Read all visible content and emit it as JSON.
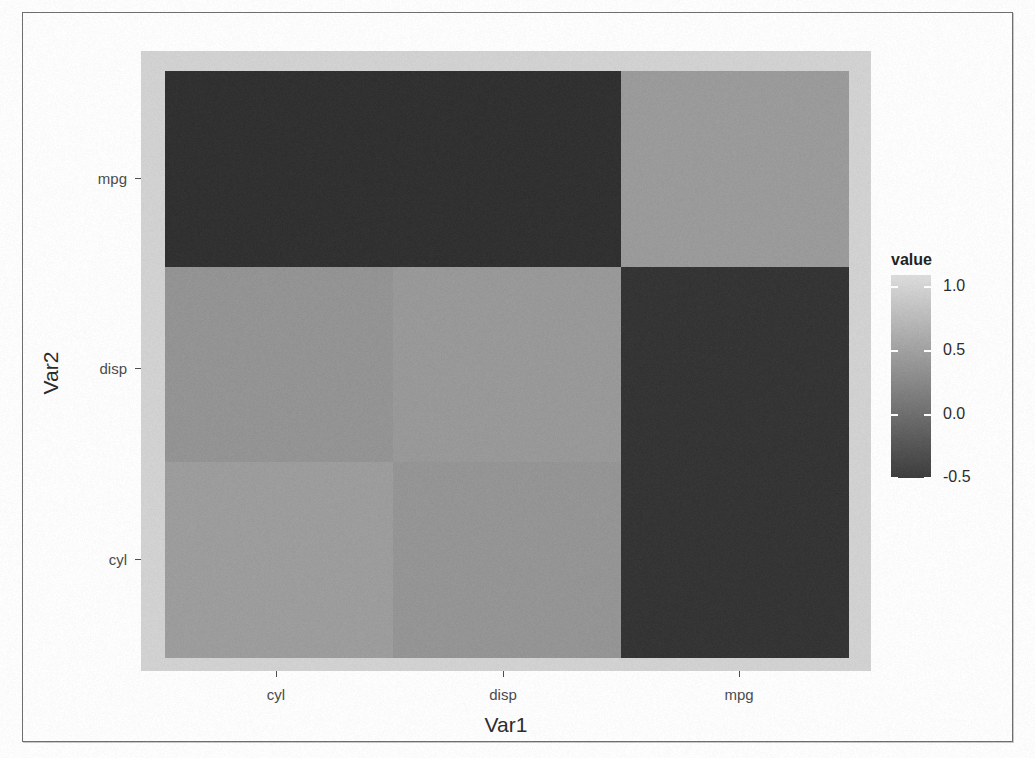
{
  "chart_data": {
    "type": "heatmap",
    "title": "",
    "xlabel": "Var1",
    "ylabel": "Var2",
    "x_categories": [
      "cyl",
      "disp",
      "mpg"
    ],
    "y_categories": [
      "cyl",
      "disp",
      "mpg"
    ],
    "legend": {
      "title": "value",
      "ticks": [
        "1.0",
        "0.5",
        "0.0",
        "-0.5"
      ],
      "tick_values": [
        1.0,
        0.5,
        0.0,
        -0.5
      ],
      "range": [
        -1.0,
        1.0
      ],
      "position": "right",
      "gradient_low": "#3b3b3b",
      "gradient_high": "#dedede"
    },
    "grid": false,
    "panel_background": "#d3d3d3",
    "cells": [
      {
        "row": "mpg",
        "col": "cyl",
        "value": -0.85,
        "color": "#2f2f2f"
      },
      {
        "row": "mpg",
        "col": "disp",
        "value": -0.85,
        "color": "#2f2f2f"
      },
      {
        "row": "mpg",
        "col": "mpg",
        "value": 1.0,
        "color": "#9b9b9b"
      },
      {
        "row": "disp",
        "col": "cyl",
        "value": 0.9,
        "color": "#949494"
      },
      {
        "row": "disp",
        "col": "disp",
        "value": 1.0,
        "color": "#999999"
      },
      {
        "row": "disp",
        "col": "mpg",
        "value": -0.85,
        "color": "#333333"
      },
      {
        "row": "cyl",
        "col": "cyl",
        "value": 1.0,
        "color": "#9d9d9d"
      },
      {
        "row": "cyl",
        "col": "disp",
        "value": 0.9,
        "color": "#959595"
      },
      {
        "row": "cyl",
        "col": "mpg",
        "value": -0.85,
        "color": "#333333"
      }
    ],
    "display_rows_top_to_bottom": [
      "mpg",
      "disp",
      "cyl"
    ],
    "ylim": [
      -1.0,
      1.0
    ]
  },
  "axes": {
    "x": {
      "title": "Var1",
      "ticks": [
        {
          "label": "cyl",
          "x": 253
        },
        {
          "label": "disp",
          "x": 480
        },
        {
          "label": "mpg",
          "x": 716
        }
      ]
    },
    "y": {
      "title": "Var2",
      "ticks": [
        {
          "label": "mpg",
          "y": 165
        },
        {
          "label": "disp",
          "y": 355
        },
        {
          "label": "cyl",
          "y": 546
        }
      ]
    }
  },
  "legend_ui": {
    "title": "value",
    "entries": [
      {
        "label": "1.0",
        "y": 11
      },
      {
        "label": "0.5",
        "y": 75
      },
      {
        "label": "0.0",
        "y": 139
      },
      {
        "label": "-0.5",
        "y": 202
      }
    ]
  }
}
